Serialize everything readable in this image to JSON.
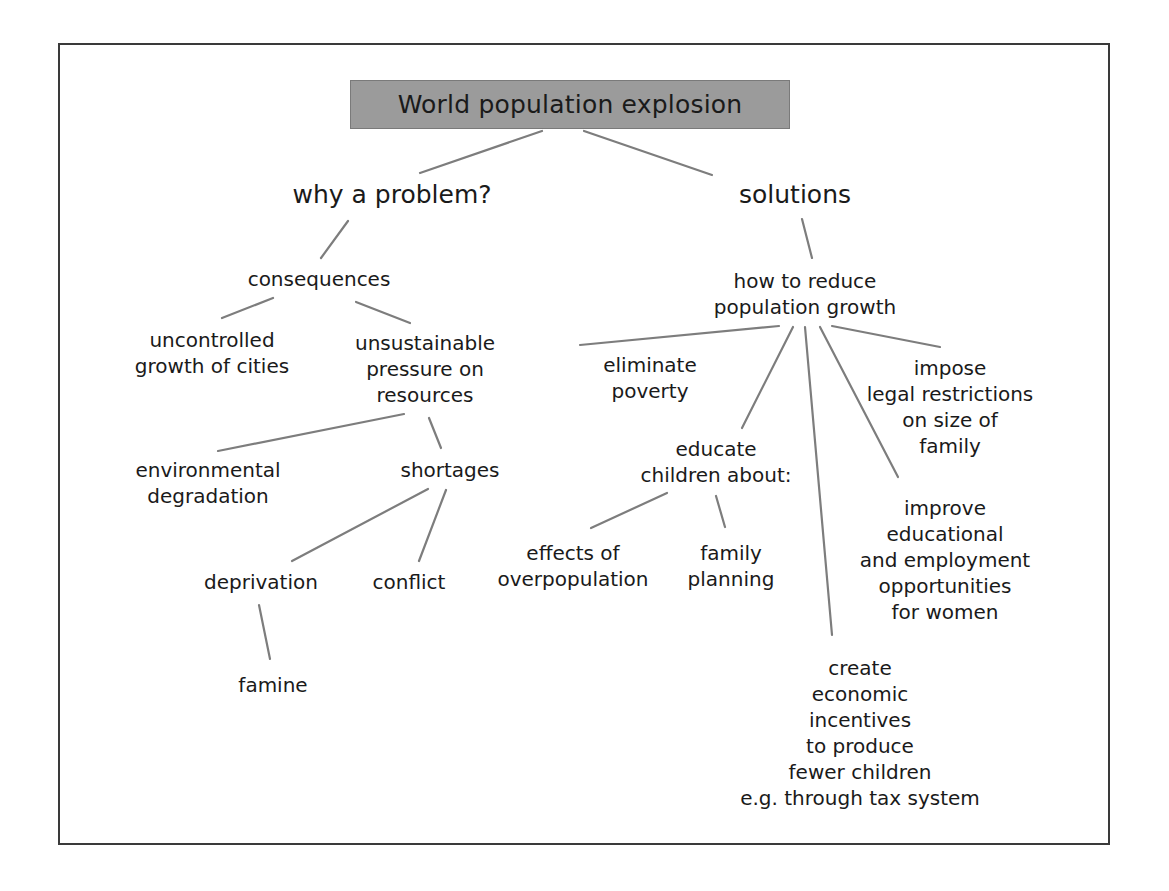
{
  "diagram": {
    "title": "World population explosion",
    "branches": {
      "problem": {
        "label": "why a problem?",
        "consequences": {
          "label": "consequences",
          "uncontrolled": "uncontrolled\ngrowth of cities",
          "unsustainable": "unsustainable\npressure on\nresources",
          "environmental": "environmental\ndegradation",
          "shortages": "shortages",
          "deprivation": "deprivation",
          "conflict": "conflict",
          "famine": "famine"
        }
      },
      "solutions": {
        "label": "solutions",
        "how": "how to reduce\npopulation growth",
        "eliminate": "eliminate\npoverty",
        "educate": "educate\nchildren about:",
        "effects": "effects of\noverpopulation",
        "family_planning": "family\nplanning",
        "create": "create\neconomic\nincentives\nto produce\nfewer children\ne.g. through tax system",
        "improve": "improve\neducational\nand employment\nopportunities\nfor women",
        "impose": "impose\nlegal restrictions\non size of\nfamily"
      }
    },
    "colors": {
      "title_fill": "#9b9b9b",
      "line": "#7d7d7d",
      "frame": "#3a3a3a",
      "text": "#1a1a1a"
    }
  }
}
